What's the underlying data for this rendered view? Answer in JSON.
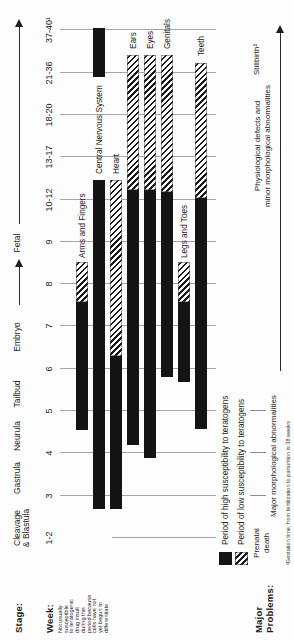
{
  "axis": {
    "stage_label": "Stage:",
    "week_label": "Week:",
    "stages": [
      {
        "label": "Cleavage",
        "label2": "& Blastula",
        "x": 113
      },
      {
        "label": "Gastrula",
        "x": 163
      },
      {
        "label": "Neurula",
        "x": 205
      },
      {
        "label": "Tailbud",
        "x": 247
      },
      {
        "label": "Embryo",
        "x": 304
      },
      {
        "label": "Fetal",
        "x": 398
      }
    ],
    "weeks": [
      {
        "label": "1-2",
        "x": 103
      },
      {
        "label": "3",
        "x": 145
      },
      {
        "label": "4",
        "x": 188
      },
      {
        "label": "5",
        "x": 230
      },
      {
        "label": "6",
        "x": 272
      },
      {
        "label": "7",
        "x": 315
      },
      {
        "label": "8",
        "x": 357
      },
      {
        "label": "9",
        "x": 399
      },
      {
        "label": "10-12",
        "x": 441
      },
      {
        "label": "13-17",
        "x": 484
      },
      {
        "label": "18-20",
        "x": 526
      },
      {
        "label": "21-36",
        "x": 568
      },
      {
        "label": "37-40¹",
        "x": 611
      }
    ]
  },
  "note_weeks_1_2": {
    "lines": [
      "Not usually",
      "susceptible",
      "to teratogenic",
      "drug insult",
      "during this",
      "period because",
      "cells have not",
      "yet begun to",
      "differentiate"
    ]
  },
  "chart_data": {
    "type": "bar",
    "title": "",
    "xlabel": "Week",
    "x_categories": [
      "1-2",
      "3",
      "4",
      "5",
      "6",
      "7",
      "8",
      "9",
      "10-12",
      "13-17",
      "18-20",
      "21-36",
      "37-40"
    ],
    "legend_position": "bottom-left",
    "grid": true,
    "bars": [
      {
        "label": "Arms and Fingers",
        "y": 76,
        "label_x": 383,
        "segments": [
          {
            "type": "high",
            "x1": 211,
            "x2": 339,
            "weeks": "~4.5–7.6"
          },
          {
            "type": "low",
            "x1": 339,
            "x2": 379,
            "weeks": "~7.6–8.5"
          }
        ]
      },
      {
        "label": "Central Nervous System",
        "y": 93,
        "label_x": 467,
        "segments": [
          {
            "type": "high",
            "x1": 132,
            "x2": 461,
            "weeks": "~3–12"
          },
          {
            "type": "high",
            "x1": 564,
            "x2": 613,
            "weeks": "~21–40"
          }
        ]
      },
      {
        "label": "Heart",
        "y": 110,
        "label_x": 467,
        "segments": [
          {
            "type": "high",
            "x1": 132,
            "x2": 285,
            "weeks": "~3–6.3"
          },
          {
            "type": "low",
            "x1": 285,
            "x2": 461,
            "weeks": "~6.3–12"
          }
        ]
      },
      {
        "label": "Ears",
        "y": 127,
        "label_x": 592,
        "segments": [
          {
            "type": "high",
            "x1": 196,
            "x2": 451,
            "weeks": "~4.2–11.5"
          },
          {
            "type": "low",
            "x1": 451,
            "x2": 586,
            "weeks": "~11.5–32"
          }
        ]
      },
      {
        "label": "Eyes",
        "y": 144,
        "label_x": 592,
        "segments": [
          {
            "type": "high",
            "x1": 183,
            "x2": 451,
            "weeks": "~3.9–11.5"
          },
          {
            "type": "low",
            "x1": 451,
            "x2": 586,
            "weeks": "~11.5–32"
          }
        ]
      },
      {
        "label": "Genitals",
        "y": 161,
        "label_x": 592,
        "segments": [
          {
            "type": "high",
            "x1": 264,
            "x2": 449,
            "weeks": "~5.8–11.5"
          },
          {
            "type": "low",
            "x1": 449,
            "x2": 586,
            "weeks": "~11.5–32"
          }
        ]
      },
      {
        "label": "Legs and Toes",
        "y": 178,
        "label_x": 383,
        "segments": [
          {
            "type": "high",
            "x1": 259,
            "x2": 339,
            "weeks": "~5.8–7.6"
          },
          {
            "type": "low",
            "x1": 339,
            "x2": 379,
            "weeks": "~7.6–8.5"
          }
        ]
      },
      {
        "label": "Teeth",
        "y": 195,
        "label_x": 585,
        "segments": [
          {
            "type": "high",
            "x1": 212,
            "x2": 443,
            "weeks": "~4.6–11"
          },
          {
            "type": "low",
            "x1": 443,
            "x2": 578,
            "weeks": "~11–28"
          }
        ]
      }
    ]
  },
  "legend": [
    {
      "type": "high",
      "label": "Period of high susceptibility to teratogens"
    },
    {
      "type": "low",
      "label": "Period of low susceptibility to teratogens"
    }
  ],
  "problems": {
    "title_line1": "Major",
    "title_line2": "Problems:",
    "prenatal": {
      "line1": "Prenatal",
      "line2": "death"
    },
    "major_morph": "Major morphological abnormalities",
    "physio_line1": "Physiological defects and",
    "physio_line2": "minor morphological abnormalities",
    "stillbirth": "Stillbirth²"
  },
  "footnote": "¹Gestation time, from fertilization to parturition is 38 weeks",
  "colors": {
    "ink": "#1c1c1c",
    "bar_high": "#141414",
    "grid": "#a6a6a6",
    "paper": "#fdfdfd"
  }
}
